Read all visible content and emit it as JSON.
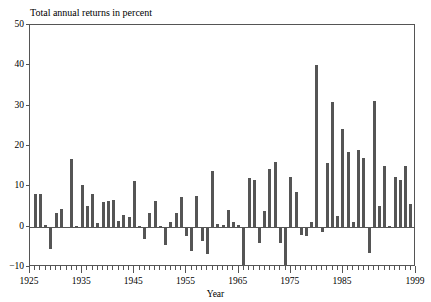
{
  "chart_data": {
    "type": "bar",
    "title": "Total annual returns in percent",
    "xlabel": "Year",
    "ylabel": "",
    "ylim": [
      -10,
      50
    ],
    "xlim": [
      1925,
      1999
    ],
    "grid": false,
    "legend": null,
    "bar_color": "#555555",
    "axis_color": "#555555",
    "yticks": [
      -10,
      0,
      10,
      20,
      30,
      40,
      50
    ],
    "ytick_labels": [
      "−10",
      "0",
      "10",
      "20",
      "30",
      "40",
      "50"
    ],
    "xticks": [
      1925,
      1935,
      1945,
      1955,
      1965,
      1975,
      1985,
      1999
    ],
    "xtick_labels": [
      "1925",
      "1935",
      "1945",
      "1955",
      "1965",
      "1975",
      "1985",
      "1999"
    ],
    "xlabel_text": "Year",
    "categories": [
      1926,
      1927,
      1928,
      1929,
      1930,
      1931,
      1932,
      1933,
      1934,
      1935,
      1936,
      1937,
      1938,
      1939,
      1940,
      1941,
      1942,
      1943,
      1944,
      1945,
      1946,
      1947,
      1948,
      1949,
      1950,
      1951,
      1952,
      1953,
      1954,
      1955,
      1956,
      1957,
      1958,
      1959,
      1960,
      1961,
      1962,
      1963,
      1964,
      1965,
      1966,
      1967,
      1968,
      1969,
      1970,
      1971,
      1972,
      1973,
      1974,
      1975,
      1976,
      1977,
      1978,
      1979,
      1980,
      1981,
      1982,
      1983,
      1984,
      1985,
      1986,
      1987,
      1988,
      1989,
      1990,
      1991,
      1992,
      1993,
      1994,
      1995,
      1996,
      1997,
      1998,
      1999
    ],
    "values": [
      8.0,
      8.0,
      0.5,
      -5.5,
      3.5,
      4.3,
      0.0,
      16.8,
      0.1,
      10.4,
      5.1,
      8.0,
      0.8,
      6.2,
      6.3,
      6.6,
      1.4,
      3.0,
      2.5,
      11.2,
      0.1,
      -3.1,
      3.4,
      6.4,
      0.2,
      -4.5,
      1.2,
      3.5,
      7.3,
      -2.2,
      -6.0,
      7.5,
      -3.5,
      -6.9,
      13.7,
      0.6,
      0.3,
      4.2,
      1.1,
      0.3,
      -9.9,
      12.0,
      11.6,
      -4.1,
      3.9,
      14.3,
      16.0,
      -4.0,
      -14.7,
      12.4,
      8.7,
      -2.0,
      -2.2,
      1.2,
      40.1,
      -1.3,
      15.8,
      30.9,
      2.6,
      24.3,
      18.4,
      1.2,
      18.9,
      17.1,
      -6.6,
      31.1,
      5.1,
      15.1,
      0.2,
      12.3,
      11.5,
      15.1,
      5.5,
      -10.0
    ]
  }
}
